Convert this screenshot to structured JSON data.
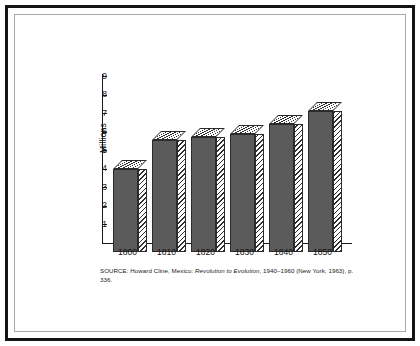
{
  "figure": {
    "ylabel": "Millions",
    "source_prefix": "SOURCE: Howard Cline, Mexico: ",
    "source_title": "Revolution to Evolution",
    "source_suffix": ", 1940–1960 (New York, 1963), p. 336."
  },
  "chart_data": {
    "type": "bar",
    "title": "",
    "xlabel": "",
    "ylabel": "Millions",
    "categories": [
      "1800",
      "1810",
      "1820",
      "1830",
      "1840",
      "1850"
    ],
    "values": [
      4.45,
      6.05,
      6.2,
      6.35,
      6.9,
      7.6
    ],
    "ylim": [
      0,
      9
    ],
    "yticks": [
      1,
      2,
      3,
      4,
      5,
      6,
      7,
      8,
      9
    ],
    "ytick_labels": [
      "1",
      "2",
      "3",
      "4",
      "5",
      "6",
      "7",
      "8",
      "9"
    ],
    "grid": false,
    "legend": null,
    "style": "3d-bar",
    "colors": {
      "bar_face": "#5b5b5b",
      "bar_hatch": "#2f2f2f",
      "outline": "#2b2b2b",
      "axis": "#1a1a1a",
      "text": "#111111",
      "frame_outer": "#141414",
      "frame_inner": "#a9a9a9",
      "background": "#ffffff"
    }
  }
}
